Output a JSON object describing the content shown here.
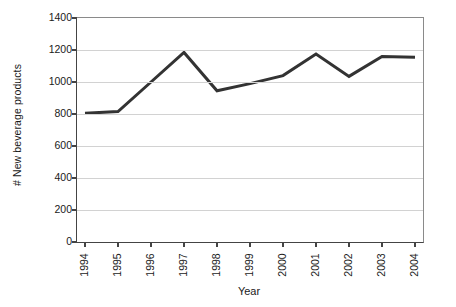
{
  "chart_data": {
    "type": "line",
    "title": "",
    "xlabel": "Year",
    "ylabel": "# New beverage products",
    "categories": [
      "1994",
      "1995",
      "1996",
      "1997",
      "1998",
      "1999",
      "2000",
      "2001",
      "2002",
      "2003",
      "2004"
    ],
    "values": [
      805,
      815,
      1000,
      1185,
      945,
      990,
      1040,
      1175,
      1035,
      1160,
      1155
    ],
    "series": [
      {
        "name": "New beverage products",
        "values": [
          805,
          815,
          1000,
          1185,
          945,
          990,
          1040,
          1175,
          1035,
          1160,
          1155
        ]
      }
    ],
    "ylim": [
      0,
      1400
    ],
    "y_ticks": [
      0,
      200,
      400,
      600,
      800,
      1000,
      1200,
      1400
    ],
    "y_tick_labels": [
      "0",
      "200",
      "400",
      "600",
      "800",
      "1000",
      "1200",
      "1400"
    ],
    "grid": true,
    "grid_axis": "y",
    "legend": false,
    "legend_position": "none",
    "markers": false,
    "line_color": "#333333",
    "line_width": 3,
    "grid_color": "#d2d2d2",
    "axis_color": "#444444",
    "background_color": "#ffffff",
    "x_tick_label_rotation": -90
  }
}
